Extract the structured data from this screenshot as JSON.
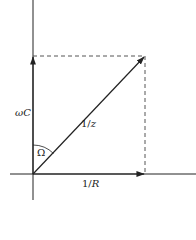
{
  "diagram": {
    "type": "phasor-admittance-diagram",
    "labels": {
      "vertical_component": "ωC",
      "horizontal_component": "1/R",
      "resultant": "1/z",
      "angle": "Ω"
    },
    "colors": {
      "line": "#222222",
      "dashed": "#555555",
      "background": "#ffffff"
    }
  }
}
